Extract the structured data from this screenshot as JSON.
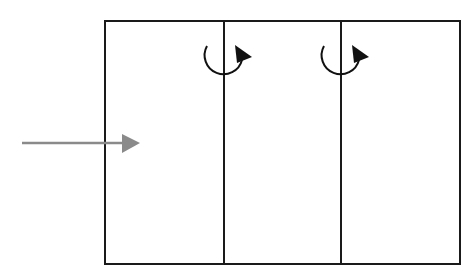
{
  "diagram": {
    "type": "flow-through-chambers",
    "container": {
      "shape": "rectangle",
      "compartments": 3
    },
    "input_arrow": {
      "direction": "right",
      "color": "#8a8a8a"
    },
    "rotation_markers": [
      {
        "position": "divider-1",
        "direction": "clockwise",
        "color": "#111111"
      },
      {
        "position": "divider-2",
        "direction": "clockwise",
        "color": "#111111"
      }
    ],
    "colors": {
      "stroke": "#1a1a1a",
      "background": "#ffffff",
      "arrow": "#8a8a8a"
    }
  }
}
